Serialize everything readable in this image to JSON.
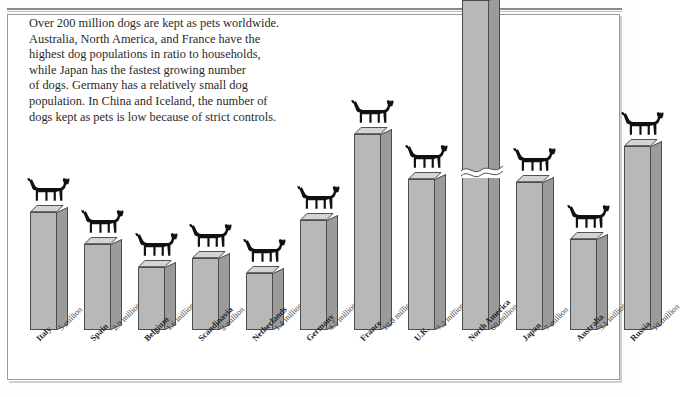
{
  "title": "DOG OWNERSHIP WORLDWIDE",
  "intro": {
    "lines": [
      "Over 200 million dogs are kept as pets worldwide.",
      "Australia, North America, and France have the",
      "highest dog populations in ratio to households,",
      "while Japan has the fastest growing number",
      "of dogs. Germany has a relatively small dog",
      "population. In China and Iceland, the number of",
      "dogs kept as pets is low because of strict controls."
    ]
  },
  "colors": {
    "bar_front": "#b8b8b8",
    "bar_side": "#9b9b9b",
    "bar_top": "#d4d4d4",
    "outline": "#4d4d4d",
    "dog": "#111111",
    "frame": "#9a9a9a",
    "background": "#fefefe"
  },
  "chart_data": {
    "type": "bar",
    "title": "DOG OWNERSHIP WORLDWIDE",
    "xlabel": "",
    "ylabel": "Dogs kept as pets (millions)",
    "grid": false,
    "legend": false,
    "axis_break": {
      "present": true,
      "category": "North America",
      "note": "Bar is broken to fit the 60 million value on the same scale."
    },
    "units": "million",
    "categories": [
      "Italy",
      "Spain",
      "Belgium",
      "Scandinavia",
      "Netherlands",
      "Germany",
      "France",
      "U.K.",
      "North America",
      "Japan",
      "Australia",
      "Russia"
    ],
    "values": [
      5,
      2.9,
      1.6,
      2,
      1.4,
      4.5,
      10.8,
      7.2,
      60,
      7,
      3.1,
      10
    ],
    "value_labels": [
      "5 million",
      "2.9 million",
      "1.6 million",
      "2 million",
      "1.4 million",
      "4.5 million",
      "10.8 million",
      "7.2 million",
      "60 million",
      "7 million",
      "3.1 million",
      "10 million"
    ],
    "ylim": [
      0,
      60
    ]
  },
  "bars": [
    {
      "name": "Italy",
      "value_label": "5 million",
      "x": 22,
      "h": 118
    },
    {
      "name": "Spain",
      "value_label": "2.9 million",
      "x": 76,
      "h": 86
    },
    {
      "name": "Belgium",
      "value_label": "1.6 million",
      "x": 130,
      "h": 63
    },
    {
      "name": "Scandinavia",
      "value_label": "2 million",
      "x": 184,
      "h": 72
    },
    {
      "name": "Netherlands",
      "value_label": "1.4 million",
      "x": 238,
      "h": 57
    },
    {
      "name": "Germany",
      "value_label": "4.5 million",
      "x": 292,
      "h": 110
    },
    {
      "name": "France",
      "value_label": "10.8 million",
      "x": 346,
      "h": 196
    },
    {
      "name": "U.K.",
      "value_label": "7.2 million",
      "x": 400,
      "h": 151
    },
    {
      "name": "North America",
      "value_label": "60 million",
      "x": 454,
      "h": 330
    },
    {
      "name": "Japan",
      "value_label": "7 million",
      "x": 508,
      "h": 148
    },
    {
      "name": "Australia",
      "value_label": "3.1 million",
      "x": 562,
      "h": 91
    },
    {
      "name": "Russia",
      "value_label": "10 million",
      "x": 616,
      "h": 184
    }
  ]
}
